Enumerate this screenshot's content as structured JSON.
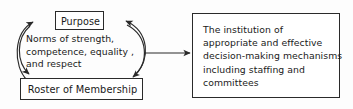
{
  "diagram": {
    "type": "cycle-flow-diagram",
    "background_color": "#fdfdfd",
    "line_color": "#2a2a2a",
    "text_color": "#1a1a1a",
    "nodes": {
      "purpose": {
        "label": "Purpose"
      },
      "roster": {
        "label": "Roster of Membership"
      },
      "institution": {
        "lines": [
          "The institution of",
          "appropriate and effective",
          "decision-making mechanisms",
          "including staffing and",
          "committees"
        ]
      }
    },
    "annotation": {
      "name": "norms",
      "lines": [
        "Norms of strength,",
        "competence, equality ,",
        "and respect"
      ]
    },
    "edges": [
      {
        "name": "roster-to-purpose",
        "from": "roster",
        "to": "purpose",
        "style": "curved-left",
        "arrowhead": "purpose"
      },
      {
        "name": "purpose-to-roster",
        "from": "purpose",
        "to": "roster",
        "style": "curved-right-down",
        "arrowhead": "roster"
      },
      {
        "name": "purpose-to-roster-left",
        "from": "purpose",
        "to": "roster",
        "style": "curved-left-down",
        "arrowhead": "roster"
      },
      {
        "name": "cycle-to-institution",
        "from": "cycle",
        "to": "institution",
        "style": "straight-horizontal",
        "arrowhead": "institution"
      }
    ]
  }
}
